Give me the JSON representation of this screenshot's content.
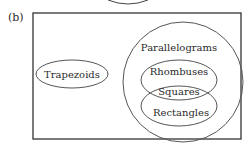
{
  "figure": {
    "panel_label": "(b)",
    "stroke_color": "#3a3a3a",
    "background": "#ffffff"
  },
  "sets": {
    "trapezoids": "Trapezoids",
    "parallelograms": "Parallelograms",
    "rhombuses": "Rhombuses",
    "squares": "Squares",
    "rectangles": "Rectangles"
  }
}
